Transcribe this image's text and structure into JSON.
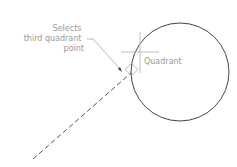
{
  "diagram": {
    "callout": {
      "lines": [
        "Selects",
        "third quadrant",
        "point"
      ]
    },
    "quadrant_label": "Quadrant",
    "colors": {
      "circle": "#444444",
      "dashed_line": "#555555",
      "annotation": "#a0a0a0",
      "text": "#9a9a9a"
    }
  }
}
